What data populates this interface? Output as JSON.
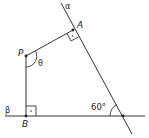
{
  "diagram": {
    "type": "geometry",
    "points": {
      "A": {
        "label": "A",
        "x": 73,
        "y": 30
      },
      "P": {
        "label": "P",
        "x": 26,
        "y": 56
      },
      "B": {
        "label": "B",
        "x": 26,
        "y": 116
      },
      "O": {
        "label": "",
        "x": 123,
        "y": 116
      }
    },
    "lines": {
      "alpha": {
        "label": "α"
      },
      "beta": {
        "label": "β"
      }
    },
    "angles": {
      "theta": {
        "label": "θ",
        "vertex": "P"
      },
      "intersection": {
        "label": "60°",
        "vertex": "O"
      }
    },
    "right_angles": [
      "A",
      "B"
    ],
    "colors": {
      "stroke": "#333333",
      "text": "#222222"
    }
  }
}
